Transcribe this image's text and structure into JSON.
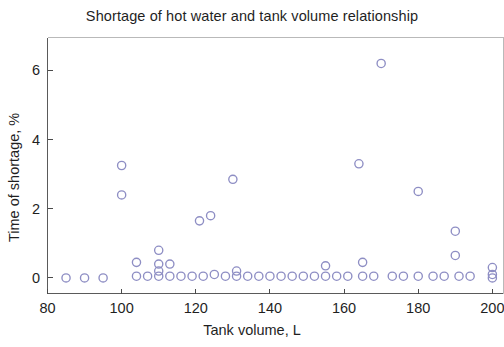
{
  "chart_data": {
    "type": "scatter",
    "title": "Shortage of hot water and tank volume relationship",
    "xlabel": "Tank volume, L",
    "ylabel": "Time of shortage, %",
    "xlim": [
      80,
      203
    ],
    "ylim": [
      -0.45,
      6.95
    ],
    "xticks": [
      80,
      100,
      120,
      140,
      160,
      180,
      200
    ],
    "xticklabels": [
      "80",
      "100",
      "120",
      "140",
      "160",
      "180",
      "200"
    ],
    "yticks": [
      0,
      2,
      4,
      6
    ],
    "yticklabels": [
      "0",
      "2",
      "4",
      "6"
    ],
    "grid": false,
    "legend": null,
    "marker": "open-circle",
    "marker_color": "#8e8ec4",
    "marker_size": 7,
    "series": [
      {
        "name": "Time of shortage vs tank volume",
        "points": [
          [
            85,
            0.0
          ],
          [
            90,
            0.0
          ],
          [
            95,
            0.0
          ],
          [
            100,
            3.25
          ],
          [
            100,
            2.4
          ],
          [
            104,
            0.45
          ],
          [
            104,
            0.05
          ],
          [
            107,
            0.05
          ],
          [
            110,
            0.8
          ],
          [
            110,
            0.4
          ],
          [
            110,
            0.2
          ],
          [
            110,
            0.05
          ],
          [
            113,
            0.4
          ],
          [
            113,
            0.05
          ],
          [
            116,
            0.05
          ],
          [
            119,
            0.05
          ],
          [
            121,
            1.65
          ],
          [
            122,
            0.05
          ],
          [
            124,
            1.8
          ],
          [
            125,
            0.1
          ],
          [
            128,
            0.05
          ],
          [
            130,
            2.85
          ],
          [
            131,
            0.2
          ],
          [
            131,
            0.05
          ],
          [
            134,
            0.05
          ],
          [
            137,
            0.05
          ],
          [
            140,
            0.05
          ],
          [
            143,
            0.05
          ],
          [
            146,
            0.05
          ],
          [
            149,
            0.05
          ],
          [
            152,
            0.05
          ],
          [
            155,
            0.35
          ],
          [
            155,
            0.05
          ],
          [
            158,
            0.05
          ],
          [
            161,
            0.05
          ],
          [
            164,
            3.3
          ],
          [
            165,
            0.45
          ],
          [
            165,
            0.05
          ],
          [
            168,
            0.05
          ],
          [
            170,
            6.2
          ],
          [
            173,
            0.05
          ],
          [
            176,
            0.05
          ],
          [
            180,
            2.5
          ],
          [
            180,
            0.05
          ],
          [
            184,
            0.05
          ],
          [
            187,
            0.05
          ],
          [
            190,
            1.35
          ],
          [
            190,
            0.65
          ],
          [
            191,
            0.05
          ],
          [
            194,
            0.05
          ],
          [
            200,
            0.3
          ],
          [
            200,
            0.1
          ],
          [
            200,
            0.0
          ]
        ]
      }
    ]
  },
  "figure": {
    "background_color": "#ffffff",
    "axis_color": "#5a5a5a"
  }
}
